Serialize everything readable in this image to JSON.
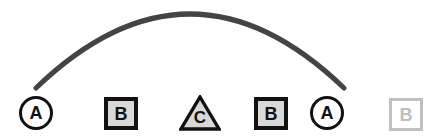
{
  "canvas": {
    "width": 439,
    "height": 138,
    "background": "#ffffff"
  },
  "connector": {
    "name": "arc-connector",
    "shape": "arc",
    "from_node": "node-a-start",
    "to_node": "node-a-end",
    "color": "#444444",
    "stroke_width": 5,
    "start_x": 36,
    "start_y": 88,
    "peak_x": 190,
    "peak_y": 14,
    "end_x": 344,
    "end_y": 88
  },
  "nodes": [
    {
      "id": "node-a-start",
      "label": "A",
      "shape": "circle",
      "x": 19,
      "y": 96,
      "fill": "#ffffff",
      "stroke": "#111111",
      "text_color": "#111111",
      "state": "active"
    },
    {
      "id": "node-b-first",
      "label": "B",
      "shape": "square",
      "x": 104,
      "y": 97,
      "fill": "#d8d8d8",
      "stroke": "#111111",
      "text_color": "#111111",
      "state": "active"
    },
    {
      "id": "node-c",
      "label": "C",
      "shape": "triangle",
      "x": 179,
      "y": 95,
      "fill": "#d8d8d8",
      "stroke": "#111111",
      "text_color": "#111111",
      "state": "active"
    },
    {
      "id": "node-b-second",
      "label": "B",
      "shape": "square",
      "x": 254,
      "y": 97,
      "fill": "#d8d8d8",
      "stroke": "#111111",
      "text_color": "#111111",
      "state": "active"
    },
    {
      "id": "node-a-end",
      "label": "A",
      "shape": "circle",
      "x": 310,
      "y": 96,
      "fill": "#ffffff",
      "stroke": "#111111",
      "text_color": "#111111",
      "state": "active"
    },
    {
      "id": "node-b-ghost",
      "label": "B",
      "shape": "square",
      "x": 389,
      "y": 98,
      "fill": "#ffffff",
      "stroke": "#c0c0c0",
      "text_color": "#bdbdbd",
      "state": "faded"
    }
  ]
}
